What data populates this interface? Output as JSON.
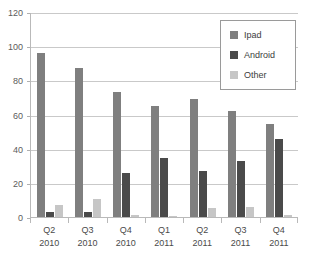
{
  "chart_data": {
    "type": "bar",
    "title": "",
    "xlabel": "",
    "ylabel": "",
    "ylim": [
      0,
      120
    ],
    "ytick_step": 20,
    "yticks": [
      0,
      20,
      40,
      60,
      80,
      100,
      120
    ],
    "ytick_labels": [
      "0",
      "20",
      "40",
      "60",
      "80",
      "100",
      "120"
    ],
    "grid": true,
    "legend_position": "top-right",
    "categories": [
      "Q2 2010",
      "Q3 2010",
      "Q4 2010",
      "Q1 2011",
      "Q2 2011",
      "Q3 2011",
      "Q4 2011"
    ],
    "category_lines": [
      {
        "quarter": "Q2",
        "year": "2010"
      },
      {
        "quarter": "Q3",
        "year": "2010"
      },
      {
        "quarter": "Q4",
        "year": "2010"
      },
      {
        "quarter": "Q1",
        "year": "2011"
      },
      {
        "quarter": "Q2",
        "year": "2011"
      },
      {
        "quarter": "Q3",
        "year": "2011"
      },
      {
        "quarter": "Q4",
        "year": "2011"
      }
    ],
    "series": [
      {
        "name": "Ipad",
        "color": "#7f7f7f",
        "values": [
          96,
          87,
          73,
          65,
          69,
          62,
          54.5
        ]
      },
      {
        "name": "Android",
        "color": "#4a4a4a",
        "values": [
          3,
          3,
          26,
          34.5,
          27,
          32.5,
          45.5
        ]
      },
      {
        "name": "Other",
        "color": "#c6c6c6",
        "values": [
          7,
          10.5,
          1,
          0.7,
          5,
          6,
          1
        ]
      }
    ]
  },
  "legend": {
    "items": [
      {
        "label": "Ipad",
        "color": "#7f7f7f"
      },
      {
        "label": "Android",
        "color": "#4a4a4a"
      },
      {
        "label": "Other",
        "color": "#c6c6c6"
      }
    ]
  },
  "colors": {
    "ipad": "#7f7f7f",
    "android": "#4a4a4a",
    "other": "#c6c6c6",
    "gridline": "#c9c9c9",
    "axis": "#b9b9b9",
    "tick_text": "#5c5c5c",
    "background": "#ffffff"
  }
}
